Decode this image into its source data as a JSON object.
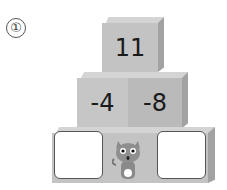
{
  "problem": {
    "number_label": "①"
  },
  "pyramid": {
    "top": {
      "value": "11"
    },
    "middle": [
      {
        "value": "-4"
      },
      {
        "value": "-8"
      }
    ],
    "bottom": [
      {
        "value": "",
        "type": "answer-box"
      },
      {
        "value": "",
        "type": "mascot",
        "icon": "cat-mascot-icon"
      },
      {
        "value": "",
        "type": "answer-box"
      }
    ]
  },
  "colors": {
    "block_front": "#c3c3c3",
    "block_top": "#d4d4d4",
    "block_side": "#a2a2a2",
    "text": "#1a1a1a"
  }
}
